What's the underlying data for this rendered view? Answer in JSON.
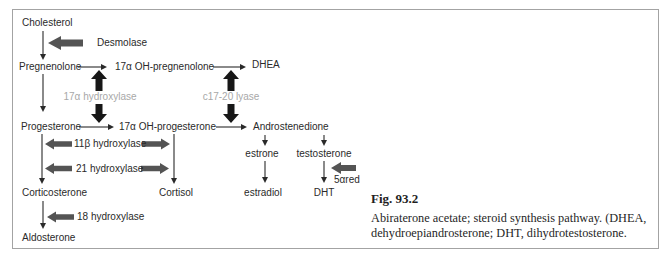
{
  "figure": {
    "caption_title": "Fig. 93.2",
    "caption_line1": "Abiraterone acetate; steroid synthesis pathway. (DHEA,",
    "caption_line2": "dehydroepiandrosterone; DHT, dihydrotestosterone."
  },
  "compounds": {
    "cholesterol": "Cholesterol",
    "pregnenolone": "Pregnenolone",
    "oh_pregnenolone": "17α OH-pregnenolone",
    "dhea": "DHEA",
    "progesterone": "Progesterone",
    "oh_progesterone": "17α OH-progesterone",
    "androstenedione": "Androstenedione",
    "estrone": "estrone",
    "testosterone": "testosterone",
    "corticosterone": "Corticosterone",
    "cortisol": "Cortisol",
    "estradiol": "estradiol",
    "dht": "DHT",
    "aldosterone": "Aldosterone"
  },
  "enzymes": {
    "desmolase": "Desmolase",
    "hydroxylase_17a": "17α hydroxylase",
    "lyase_c17_20": "c17-20 lyase",
    "hydroxylase_11b": "11β hydroxylase",
    "hydroxylase_21": "21 hydroxylase",
    "hydroxylase_18": "18 hydroxylase",
    "reductase_5a": "5αred"
  },
  "colors": {
    "thin_arrow": "#2a2a2a",
    "block_arrow_gray": "#545454",
    "block_arrow_black": "#171717",
    "enzyme_gray_label": "#a8a8a8",
    "box_border": "#a3a3a3",
    "background": "#ffffff"
  }
}
